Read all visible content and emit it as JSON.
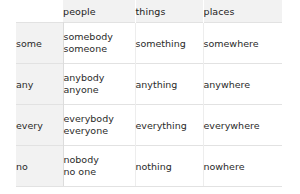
{
  "table": {
    "name": "indefinite-pronouns",
    "corner_label": "",
    "columns": [
      "people",
      "things",
      "places"
    ],
    "rows": [
      {
        "label": "some",
        "people": [
          "somebody",
          "someone"
        ],
        "things": [
          "something"
        ],
        "places": [
          "somewhere"
        ]
      },
      {
        "label": "any",
        "people": [
          "anybody",
          "anyone"
        ],
        "things": [
          "anything"
        ],
        "places": [
          "anywhere"
        ]
      },
      {
        "label": "every",
        "people": [
          "everybody",
          "everyone"
        ],
        "things": [
          "everything"
        ],
        "places": [
          "everywhere"
        ]
      },
      {
        "label": "no",
        "people": [
          "nobody",
          "no one"
        ],
        "things": [
          "nothing"
        ],
        "places": [
          "nowhere"
        ]
      }
    ]
  },
  "colors": {
    "header_background": "#f2f2f2",
    "row_label_background": "#f2f2f2",
    "cell_background": "#ffffff",
    "border": "#e2e2e2",
    "header_text": "#1c1c1c",
    "cell_text": "#2a2a2a",
    "page_background": "#ffffff"
  }
}
